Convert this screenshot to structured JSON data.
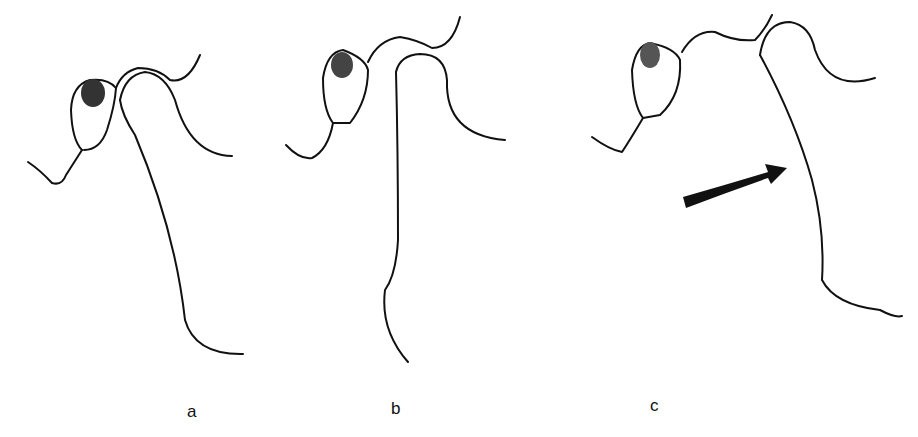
{
  "figure": {
    "panels": [
      {
        "id": "a",
        "label": "a"
      },
      {
        "id": "b",
        "label": "b"
      },
      {
        "id": "c",
        "label": "c"
      }
    ],
    "annotation": {
      "type": "arrow",
      "panel": "c",
      "direction": "right-up"
    },
    "colors": {
      "ink": "#111111",
      "background": "#ffffff"
    }
  }
}
